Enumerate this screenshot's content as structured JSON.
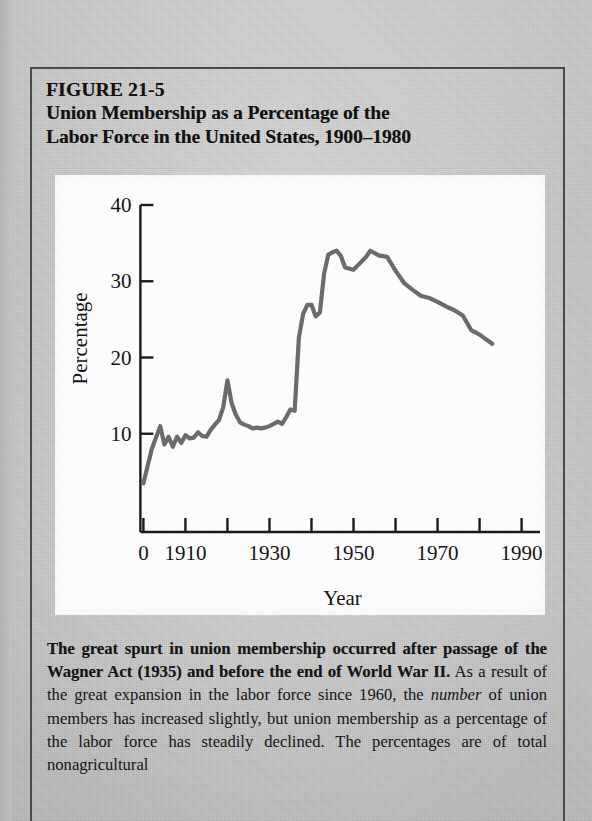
{
  "figure": {
    "number_label": "FIGURE 21-5",
    "title_line1": "Union Membership as a Percentage of the",
    "title_line2": "Labor Force in the United States, 1900–1980"
  },
  "caption": {
    "bold_part": "The great spurt in union membership occurred after passage of the Wagner Act (1935) and before the end of World War II.",
    "rest_part_1": " As a result of the great expansion in the labor force since 1960, the ",
    "italic_word": "number",
    "rest_part_2": " of union members has increased slightly, but union membership as a percentage of the labor force has steadily declined. The percentages are of total nonagricultural"
  },
  "chart_data": {
    "type": "line",
    "xlabel": "Year",
    "ylabel": "Percentage",
    "xlim": [
      1898,
      1992
    ],
    "ylim": [
      0,
      40
    ],
    "grid": false,
    "legend": "none",
    "line_color": "#6b6b6b",
    "axis_color": "#1a1a1a",
    "y_ticks": [
      10,
      20,
      30,
      40
    ],
    "y_tick_labels": [
      "10",
      "20",
      "30",
      "40"
    ],
    "x_ticks": [
      1900,
      1910,
      1920,
      1930,
      1940,
      1950,
      1960,
      1970,
      1980,
      1990
    ],
    "x_tick_labels_shown": [
      "0",
      "1910",
      "1930",
      "1950",
      "1970",
      "1990"
    ],
    "x_label_positions": [
      1900,
      1910,
      1930,
      1950,
      1970,
      1990
    ],
    "x": [
      1900,
      1902,
      1904,
      1905,
      1906,
      1907,
      1908,
      1909,
      1910,
      1911,
      1912,
      1913,
      1914,
      1915,
      1916,
      1917,
      1918,
      1919,
      1920,
      1921,
      1922,
      1923,
      1924,
      1925,
      1926,
      1927,
      1928,
      1929,
      1930,
      1931,
      1932,
      1933,
      1934,
      1935,
      1936,
      1937,
      1938,
      1939,
      1940,
      1941,
      1942,
      1943,
      1944,
      1945,
      1946,
      1947,
      1948,
      1950,
      1953,
      1954,
      1956,
      1958,
      1960,
      1962,
      1964,
      1966,
      1968,
      1970,
      1972,
      1974,
      1976,
      1978,
      1980,
      1983
    ],
    "y": [
      3.5,
      8.0,
      11.0,
      8.6,
      9.6,
      8.3,
      9.6,
      8.8,
      9.8,
      9.4,
      9.5,
      10.2,
      9.7,
      9.6,
      10.5,
      11.2,
      11.8,
      13.5,
      17.0,
      14.0,
      12.5,
      11.5,
      11.2,
      11.0,
      10.7,
      10.8,
      10.7,
      10.8,
      11.0,
      11.3,
      11.6,
      11.3,
      12.2,
      13.2,
      13.0,
      22.6,
      25.7,
      26.9,
      26.9,
      25.4,
      25.9,
      31.0,
      33.5,
      33.8,
      34.0,
      33.3,
      31.8,
      31.5,
      33.2,
      34.0,
      33.4,
      33.2,
      31.4,
      29.8,
      28.9,
      28.1,
      27.8,
      27.3,
      26.7,
      26.2,
      25.5,
      23.6,
      23.0,
      21.8
    ]
  }
}
